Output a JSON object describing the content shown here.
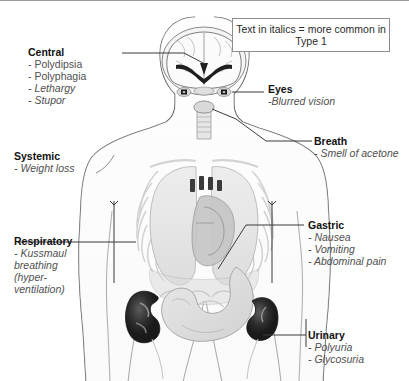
{
  "figure": {
    "legend": "Text in italics = more common in Type 1"
  },
  "callouts": [
    {
      "id": "central",
      "heading": "Central",
      "items": [
        {
          "text": "- Polydipsia",
          "italic": false
        },
        {
          "text": "- Polyphagia",
          "italic": false
        },
        {
          "text": "- Lethargy",
          "italic": true
        },
        {
          "text": "- Stupor",
          "italic": true
        }
      ]
    },
    {
      "id": "eyes",
      "heading": "Eyes",
      "items": [
        {
          "text": "-Blurred vision",
          "italic": true
        }
      ]
    },
    {
      "id": "breath",
      "heading": "Breath",
      "items": [
        {
          "text": "- Smell of acetone",
          "italic": true
        }
      ]
    },
    {
      "id": "systemic",
      "heading": "Systemic",
      "items": [
        {
          "text": "- Weight loss",
          "italic": true
        }
      ]
    },
    {
      "id": "respiratory",
      "heading": "Respiratory",
      "items": [
        {
          "text": "- Kussmaul breathing (hyper-ventilation)",
          "italic": true
        }
      ]
    },
    {
      "id": "gastric",
      "heading": "Gastric",
      "items": [
        {
          "text": "- Nausea",
          "italic": true
        },
        {
          "text": "- Vomiting",
          "italic": true
        },
        {
          "text": "- Abdominal pain",
          "italic": true
        }
      ]
    },
    {
      "id": "urinary",
      "heading": "Urinary",
      "items": [
        {
          "text": "- Polyuria",
          "italic": true
        },
        {
          "text": "- Glycosuria",
          "italic": true
        }
      ]
    }
  ],
  "anatomy": {
    "regions": [
      "brain",
      "eyes",
      "trachea",
      "lungs",
      "ribcage",
      "heart",
      "stomach",
      "kidney-left",
      "kidney-right",
      "body-outline"
    ]
  },
  "colors": {
    "outline": "#5a5a5a",
    "leader": "#444444",
    "heading_text": "#111111",
    "item_text": "#4f4f4f",
    "organ_light": "#e3e3e3",
    "organ_mid": "#cfcfcf",
    "organ_dark": "#2a2a2a",
    "background": "#ffffff"
  }
}
